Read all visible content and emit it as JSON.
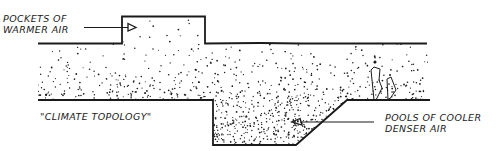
{
  "diagram": {
    "title": "\"CLIMATE TOPOLOGY\"",
    "labels": {
      "warm": {
        "line1": "POCKETS OF",
        "line2": "WARMER AIR"
      },
      "cool": {
        "line1": "POOLS OF COOLER",
        "line2": "DENSER AIR"
      },
      "caption": "\"CLIMATE TOPOLOGY\""
    },
    "colors": {
      "ink": "#1a1a1a",
      "background": "#ffffff"
    },
    "regions": [
      {
        "name": "warm-pocket",
        "description": "raised rectangular pocket above the upper boundary, sparse stipple"
      },
      {
        "name": "air-band",
        "description": "stippled air layer between upper and lower ground lines"
      },
      {
        "name": "cool-pool",
        "description": "depression below the lower ground line, dense stipple"
      }
    ],
    "features": [
      "arrow-to-warm-pocket",
      "arrow-to-cool-pool",
      "vertical-figures-near-right"
    ]
  }
}
